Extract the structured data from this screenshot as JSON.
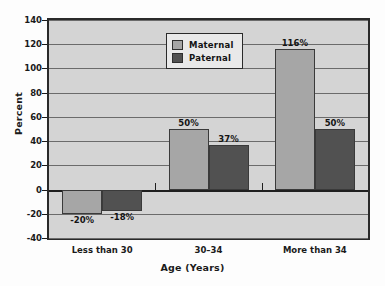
{
  "chart_data": {
    "type": "bar",
    "title": "",
    "xlabel": "Age (Years)",
    "ylabel": "Percent",
    "categories": [
      "Less than 30",
      "30–34",
      "More than 34"
    ],
    "series": [
      {
        "name": "Maternal",
        "color": "#a6a6a6",
        "values": [
          -20,
          50,
          116
        ],
        "labels": [
          "-20%",
          "50%",
          "116%"
        ]
      },
      {
        "name": "Paternal",
        "color": "#515151",
        "values": [
          -18,
          37,
          50
        ],
        "labels": [
          "-18%",
          "37%",
          "50%"
        ]
      }
    ],
    "ylim": [
      -40,
      140
    ],
    "yticks": [
      140,
      120,
      100,
      80,
      60,
      40,
      20,
      0,
      -20,
      -40
    ],
    "ytick_labels": [
      "140",
      "120",
      "100",
      "80",
      "60",
      "40",
      "20",
      "0",
      "-20",
      "-40"
    ],
    "grid": true,
    "legend_position": "upper center",
    "plot_background": "#d4d4d4",
    "axis_color": "#2a2a2a"
  },
  "legend": {
    "entries": [
      {
        "label": "Maternal"
      },
      {
        "label": "Paternal"
      }
    ]
  }
}
